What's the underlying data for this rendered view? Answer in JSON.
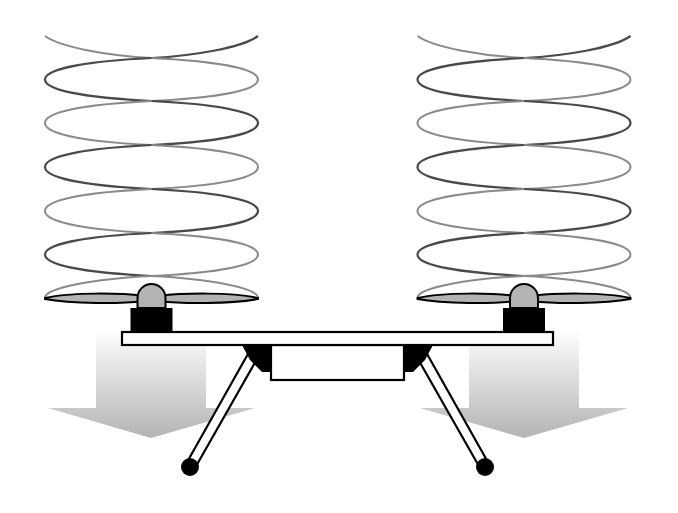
{
  "diagram": {
    "title": "Quadcopter rotor downwash illustration",
    "labels": [],
    "colors": {
      "background": "#ffffff",
      "outline": "#000000",
      "helix_dark": "#4a4a4a",
      "helix_light": "#8a8a8a",
      "propeller_fill": "#b3b3b3",
      "motor_fill": "#000000",
      "arrow_top": "#f4f4f4",
      "arrow_bottom": "#b8b8b8"
    },
    "rotors": [
      {
        "id": "left",
        "center_x": 151,
        "helix_left": 45,
        "helix_right": 258,
        "helix_top": 36,
        "propeller_y": 298
      },
      {
        "id": "right",
        "center_x": 524,
        "helix_left": 418,
        "helix_right": 630,
        "helix_top": 36,
        "propeller_y": 298
      }
    ],
    "components": [
      "helical airflow",
      "propeller",
      "motor",
      "arm",
      "body",
      "landing legs",
      "downwash arrow"
    ]
  }
}
